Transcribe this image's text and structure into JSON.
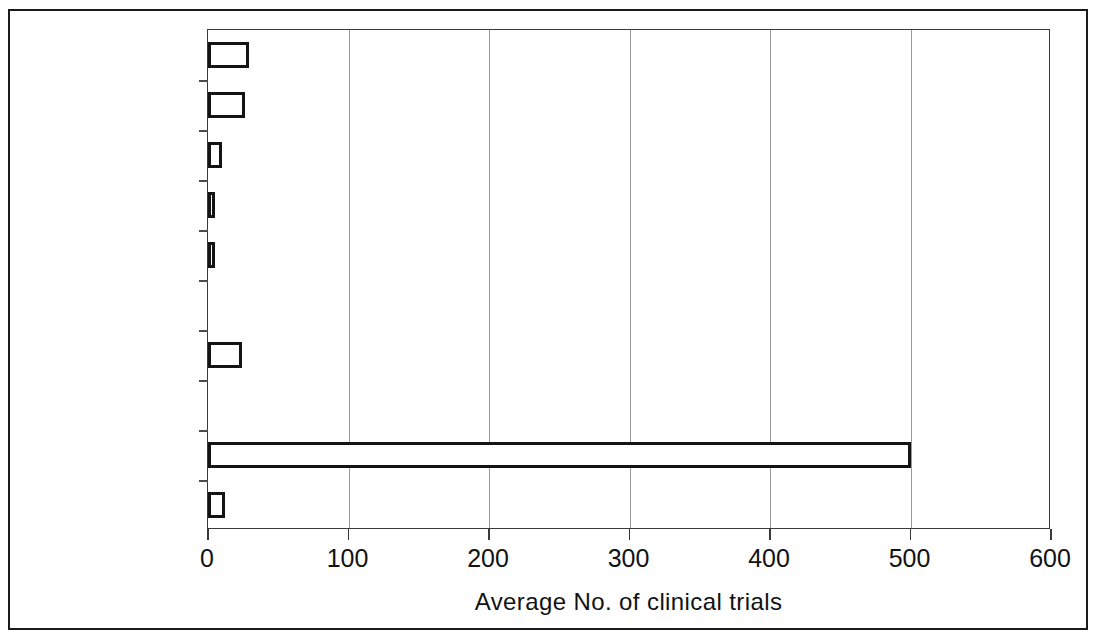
{
  "chart_data": {
    "type": "bar",
    "orientation": "horizontal",
    "title": "",
    "xlabel": "Average No. of clinical trials",
    "ylabel": "",
    "categories": [
      "Venezuela",
      "Cuba",
      "Tunisia",
      "Zimbabwe",
      "Uganda",
      "Cyprus",
      "Estonia",
      "Netherlands",
      "Australia",
      "Malaysia"
    ],
    "values": [
      29,
      26,
      10,
      5,
      5,
      0,
      24,
      0,
      500,
      12
    ],
    "xlim": [
      0,
      600
    ],
    "xticks": [
      0,
      100,
      200,
      300,
      400,
      500,
      600
    ],
    "xticklabels": [
      "0",
      "100",
      "200",
      "300",
      "400",
      "500",
      "600"
    ],
    "grid": true,
    "grid_axis": "x",
    "legend": null,
    "bar_fill": "#ffffff",
    "bar_edge": "#141414",
    "axis_color": "#3a3a3a",
    "gridline_color": "#9a9a9a"
  }
}
